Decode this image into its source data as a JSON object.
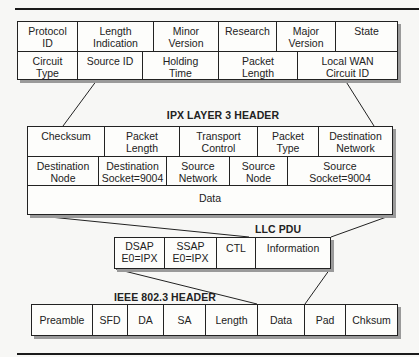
{
  "diagram": {
    "wan_header": {
      "row1": [
        "Protocol\nID",
        "Length\nIndication",
        "Minor\nVersion",
        "Research",
        "Major\nVersion",
        "State"
      ],
      "row2": [
        "Circuit\nType",
        "Source ID",
        "Holding\nTime",
        "Packet\nLength",
        "Local WAN\nCircuit ID"
      ]
    },
    "ipx": {
      "title": "IPX LAYER 3 HEADER",
      "row1": [
        "Checksum",
        "Packet\nLength",
        "Transport\nControl",
        "Packet\nType",
        "Destination\nNetwork"
      ],
      "row2": [
        "Destination\nNode",
        "Destination\nSocket=9004",
        "Source\nNetwork",
        "Source\nNode",
        "Source\nSocket=9004"
      ],
      "row3": [
        "Data"
      ]
    },
    "llc": {
      "title": "LLC PDU",
      "row1": [
        "DSAP\nE0=IPX",
        "SSAP\nE0=IPX",
        "CTL",
        "Information"
      ]
    },
    "ieee": {
      "title": "IEEE 802.3 HEADER",
      "row1": [
        "Preamble",
        "SFD",
        "DA",
        "SA",
        "Length",
        "Data",
        "Pad",
        "Chksum"
      ]
    }
  }
}
